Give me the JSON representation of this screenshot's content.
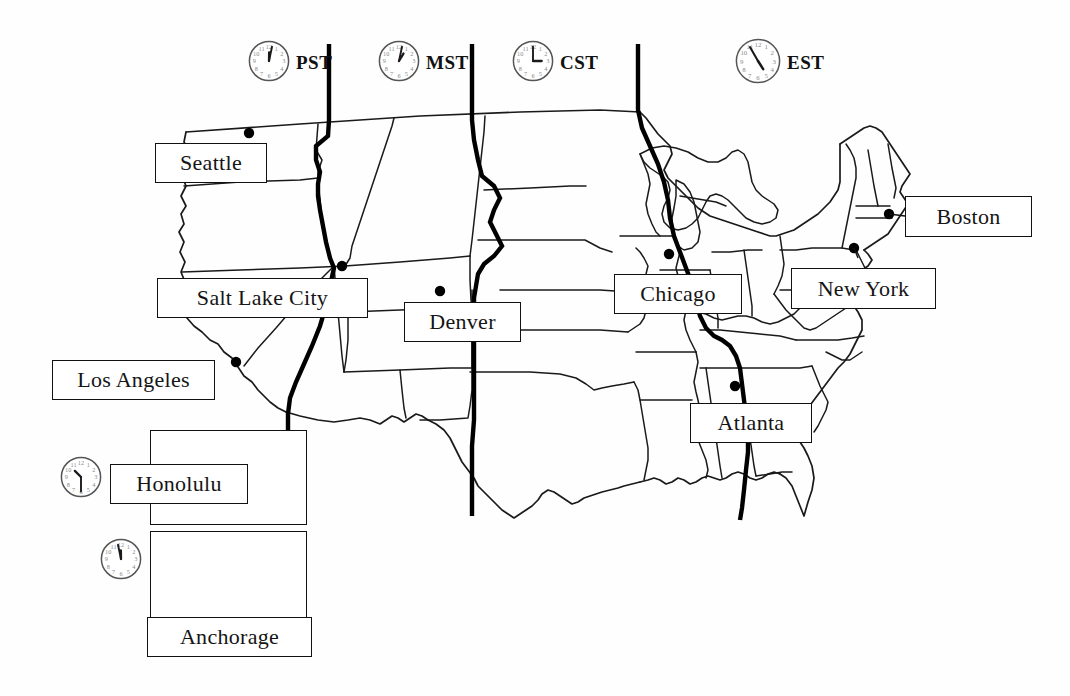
{
  "colors": {
    "ink": "#111111",
    "paper": "#fefefe",
    "state_border": "#1a1a1a",
    "timezone_line": "#000000",
    "city_dot": "#000000"
  },
  "timezone_header": [
    {
      "abbr": "PST",
      "name": "Pacific Standard Time",
      "icon": "clock-icon",
      "clock_hour": 12,
      "clock_minute": 2,
      "x": 248,
      "y": 40,
      "clock_size": 42
    },
    {
      "abbr": "MST",
      "name": "Mountain Standard Time",
      "icon": "clock-icon",
      "clock_hour": 1,
      "clock_minute": 2,
      "x": 378,
      "y": 40,
      "clock_size": 42
    },
    {
      "abbr": "CST",
      "name": "Central Standard Time",
      "icon": "clock-icon",
      "clock_hour": 3,
      "clock_minute": 0,
      "x": 512,
      "y": 40,
      "clock_size": 42
    },
    {
      "abbr": "EST",
      "name": "Eastern Standard Time",
      "icon": "clock-icon",
      "clock_hour": 4,
      "clock_minute": 55,
      "x": 735,
      "y": 38,
      "clock_size": 46
    }
  ],
  "cities": [
    {
      "name": "Seattle",
      "box": {
        "x": 155,
        "y": 143,
        "w": 112,
        "h": 40
      },
      "font_size": 22,
      "dot": {
        "x": 249,
        "y": 133
      }
    },
    {
      "name": "Salt Lake City",
      "box": {
        "x": 157,
        "y": 278,
        "w": 211,
        "h": 40
      },
      "font_size": 22,
      "dot": {
        "x": 342,
        "y": 266
      }
    },
    {
      "name": "Los Angeles",
      "box": {
        "x": 52,
        "y": 360,
        "w": 163,
        "h": 40
      },
      "font_size": 22,
      "dot": {
        "x": 236,
        "y": 362
      }
    },
    {
      "name": "Denver",
      "box": {
        "x": 404,
        "y": 302,
        "w": 117,
        "h": 40
      },
      "font_size": 22,
      "dot": {
        "x": 440,
        "y": 291
      }
    },
    {
      "name": "Chicago",
      "box": {
        "x": 614,
        "y": 274,
        "w": 128,
        "h": 40
      },
      "font_size": 22,
      "dot": {
        "x": 669,
        "y": 254
      }
    },
    {
      "name": "Atlanta",
      "box": {
        "x": 690,
        "y": 403,
        "w": 122,
        "h": 40
      },
      "font_size": 22,
      "dot": {
        "x": 735,
        "y": 386
      }
    },
    {
      "name": "New York",
      "box": {
        "x": 791,
        "y": 268,
        "w": 145,
        "h": 41
      },
      "font_size": 22,
      "dot": {
        "x": 854,
        "y": 248
      }
    },
    {
      "name": "Boston",
      "box": {
        "x": 905,
        "y": 196,
        "w": 127,
        "h": 41
      },
      "font_size": 22,
      "dot": {
        "x": 889,
        "y": 214
      }
    },
    {
      "name": "Honolulu",
      "box": {
        "x": 110,
        "y": 464,
        "w": 138,
        "h": 40
      },
      "font_size": 22,
      "dot": {
        "x": 205,
        "y": 458
      }
    },
    {
      "name": "Anchorage",
      "box": {
        "x": 147,
        "y": 617,
        "w": 165,
        "h": 40
      },
      "font_size": 22,
      "dot": {
        "x": 229,
        "y": 597
      }
    }
  ],
  "insets": [
    {
      "label": "hawaii-inset",
      "region": "Hawaii",
      "x": 150,
      "y": 430,
      "w": 157,
      "h": 95,
      "clock_icon": "clock-icon",
      "clock_hour": 10,
      "clock_minute": 30,
      "clock_x": 60,
      "clock_y": 456,
      "clock_size": 42
    },
    {
      "label": "alaska-inset",
      "region": "Alaska",
      "x": 150,
      "y": 531,
      "w": 157,
      "h": 100,
      "clock_icon": "clock-icon",
      "clock_hour": 11,
      "clock_minute": 58,
      "clock_x": 100,
      "clock_y": 538,
      "clock_size": 42
    }
  ],
  "legend_note": "Clocks above each time zone column show the local standard time."
}
